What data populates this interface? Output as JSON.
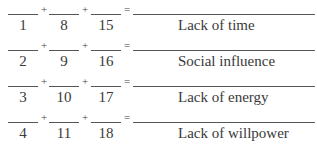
{
  "worksheet": {
    "operators": {
      "plus": "+",
      "equals": "="
    },
    "rows": [
      {
        "items": [
          "1",
          "8",
          "15"
        ],
        "label": "Lack of time"
      },
      {
        "items": [
          "2",
          "9",
          "16"
        ],
        "label": "Social influence"
      },
      {
        "items": [
          "3",
          "10",
          "17"
        ],
        "label": "Lack of energy"
      },
      {
        "items": [
          "4",
          "11",
          "18"
        ],
        "label": "Lack of willpower"
      }
    ]
  }
}
